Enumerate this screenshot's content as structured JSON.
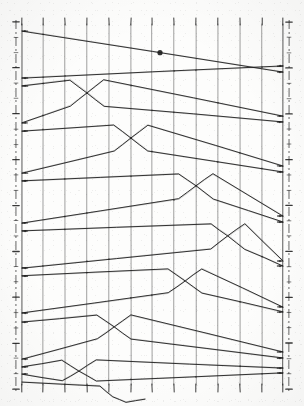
{
  "figure": {
    "kind": "braid-crossing-diagram",
    "ink_color": "#1c1c1c",
    "grid_color": "#4a4a4a",
    "paper_color": "#fdfdfc",
    "width": 304,
    "height": 406
  },
  "chart_data": {
    "type": "line",
    "xlabel": "",
    "ylabel": "",
    "grid": true,
    "legend": null,
    "axis": {
      "left_x": 22,
      "right_x": 283,
      "top_y": 24,
      "bottom_y": 385,
      "left_ticks": 24,
      "right_ticks": 24,
      "top_ticks": 13,
      "bottom_ticks": 13
    },
    "x_gridlines": [
      22,
      43,
      65,
      87,
      109,
      131,
      152,
      174,
      196,
      218,
      240,
      262,
      283
    ],
    "series": [
      {
        "name": "pair-1-upper",
        "left_y": 31,
        "right_y": 72,
        "cross_x": null,
        "values": [
          [
            22,
            31
          ],
          [
            283,
            72
          ]
        ]
      },
      {
        "name": "pair-1-lower",
        "left_y": 78,
        "right_y": 66,
        "cross_x": null,
        "values": [
          [
            22,
            78
          ],
          [
            283,
            66
          ]
        ]
      },
      {
        "name": "pair-2-upper",
        "left_y": 86,
        "right_y": 122,
        "cross_x": 87,
        "values": [
          [
            22,
            86
          ],
          [
            70,
            80
          ],
          [
            87,
            93
          ],
          [
            104,
            106
          ],
          [
            283,
            122
          ]
        ]
      },
      {
        "name": "pair-2-lower",
        "left_y": 123,
        "right_y": 116,
        "cross_x": 87,
        "values": [
          [
            22,
            123
          ],
          [
            70,
            106
          ],
          [
            87,
            93
          ],
          [
            104,
            80
          ],
          [
            283,
            116
          ]
        ]
      },
      {
        "name": "pair-3-upper",
        "left_y": 131,
        "right_y": 172,
        "cross_x": 131,
        "values": [
          [
            22,
            131
          ],
          [
            114,
            125
          ],
          [
            131,
            138
          ],
          [
            148,
            151
          ],
          [
            283,
            172
          ]
        ]
      },
      {
        "name": "pair-3-lower",
        "left_y": 173,
        "right_y": 166,
        "cross_x": 131,
        "values": [
          [
            22,
            173
          ],
          [
            114,
            151
          ],
          [
            131,
            138
          ],
          [
            148,
            125
          ],
          [
            283,
            166
          ]
        ]
      },
      {
        "name": "pair-4-upper",
        "left_y": 181,
        "right_y": 222,
        "cross_x": 196,
        "values": [
          [
            22,
            181
          ],
          [
            179,
            174
          ],
          [
            196,
            186
          ],
          [
            213,
            199
          ],
          [
            283,
            222
          ]
        ]
      },
      {
        "name": "pair-4-lower",
        "left_y": 223,
        "right_y": 216,
        "cross_x": 196,
        "values": [
          [
            22,
            223
          ],
          [
            179,
            199
          ],
          [
            196,
            186
          ],
          [
            213,
            174
          ],
          [
            283,
            216
          ]
        ]
      },
      {
        "name": "pair-5-upper",
        "left_y": 231,
        "right_y": 266,
        "cross_x": 228,
        "values": [
          [
            22,
            231
          ],
          [
            211,
            224
          ],
          [
            228,
            236
          ],
          [
            245,
            249
          ],
          [
            283,
            266
          ]
        ]
      },
      {
        "name": "pair-5-lower",
        "left_y": 268,
        "right_y": 261,
        "cross_x": 228,
        "values": [
          [
            22,
            268
          ],
          [
            211,
            249
          ],
          [
            228,
            236
          ],
          [
            245,
            224
          ],
          [
            283,
            261
          ]
        ]
      },
      {
        "name": "pair-6-upper",
        "left_y": 276,
        "right_y": 312,
        "cross_x": 185,
        "values": [
          [
            22,
            276
          ],
          [
            168,
            269
          ],
          [
            185,
            281
          ],
          [
            202,
            293
          ],
          [
            283,
            312
          ]
        ]
      },
      {
        "name": "pair-6-lower",
        "left_y": 313,
        "right_y": 307,
        "cross_x": 185,
        "values": [
          [
            22,
            313
          ],
          [
            168,
            293
          ],
          [
            185,
            281
          ],
          [
            202,
            269
          ],
          [
            283,
            307
          ]
        ]
      },
      {
        "name": "pair-7-upper",
        "left_y": 322,
        "right_y": 358,
        "cross_x": 114,
        "values": [
          [
            22,
            322
          ],
          [
            97,
            315
          ],
          [
            114,
            327
          ],
          [
            131,
            339
          ],
          [
            283,
            358
          ]
        ]
      },
      {
        "name": "pair-7-lower",
        "left_y": 359,
        "right_y": 352,
        "cross_x": 114,
        "values": [
          [
            22,
            359
          ],
          [
            97,
            339
          ],
          [
            114,
            327
          ],
          [
            131,
            315
          ],
          [
            283,
            352
          ]
        ]
      },
      {
        "name": "pair-8-upper",
        "left_y": 367,
        "right_y": 373,
        "cross_x": 79,
        "values": [
          [
            22,
            367
          ],
          [
            62,
            360
          ],
          [
            79,
            371
          ],
          [
            96,
            381
          ],
          [
            283,
            373
          ]
        ]
      },
      {
        "name": "pair-8-lower",
        "left_y": 374,
        "right_y": 368,
        "cross_x": 79,
        "values": [
          [
            22,
            374
          ],
          [
            62,
            381
          ],
          [
            79,
            371
          ],
          [
            96,
            360
          ],
          [
            283,
            368
          ]
        ]
      },
      {
        "name": "tail-crossing-lower",
        "left_y": 385,
        "right_y": 385,
        "cross_x": 113,
        "values": [
          [
            22,
            382
          ],
          [
            100,
            386
          ],
          [
            113,
            397
          ],
          [
            126,
            402
          ],
          [
            145,
            399
          ]
        ]
      }
    ],
    "crossing_count": 8,
    "pair_count": 8
  },
  "annotations": {
    "top_marker_label": "",
    "bottom_marker_label": "",
    "left_axis_label": "",
    "right_axis_label": ""
  }
}
